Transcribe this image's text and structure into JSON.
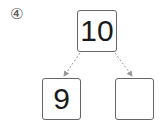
{
  "problem": {
    "number_label": "④",
    "top_value": "10",
    "left_value": "9",
    "right_value": ""
  },
  "colors": {
    "box_border": "#666666",
    "arrow": "#999999",
    "text": "#1a1a1a"
  }
}
